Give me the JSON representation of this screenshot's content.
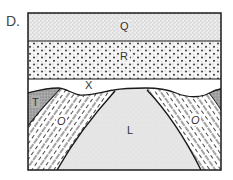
{
  "figure": {
    "label": "D."
  },
  "layers": [
    {
      "id": "Q",
      "label": "Q",
      "pattern": "fine-stipple",
      "position": "top horizontal layer"
    },
    {
      "id": "R",
      "label": "R",
      "pattern": "coarse-dots",
      "position": "horizontal layer below Q"
    },
    {
      "id": "X",
      "label": "X",
      "pattern": "none",
      "position": "unconformity surface"
    },
    {
      "id": "T",
      "label": "T",
      "pattern": "dark-stipple",
      "position": "outer folded layer (left and right edges)"
    },
    {
      "id": "O",
      "label": "O",
      "pattern": "dashed-hatch",
      "position": "folded layer flanking core (left)"
    },
    {
      "id": "O2",
      "label": "O",
      "pattern": "dashed-hatch",
      "position": "folded layer flanking core (right)"
    },
    {
      "id": "L",
      "label": "L",
      "pattern": "light-stipple",
      "position": "anticline core"
    }
  ],
  "colors": {
    "outline": "#1a1a1a",
    "q_fill": "#e9e9e9",
    "r_fill": "#f4f4f4",
    "t_fill": "#a9a9a9",
    "l_fill": "#e6e6e6",
    "o_fill": "#ffffff"
  }
}
